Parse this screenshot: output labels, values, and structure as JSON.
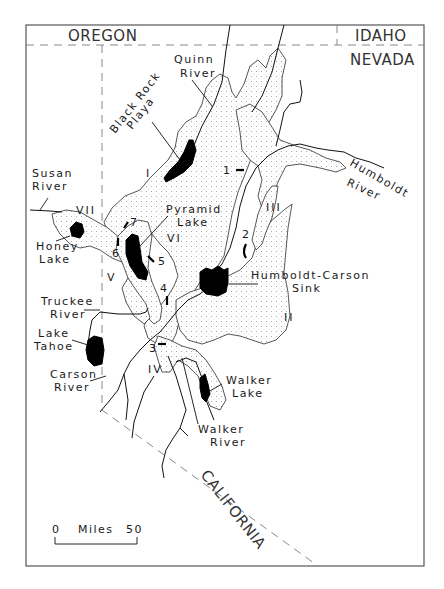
{
  "map": {
    "states": {
      "oregon": "OREGON",
      "idaho": "IDAHO",
      "nevada": "NEVADA",
      "california": "CALIFORNIA"
    },
    "features": {
      "quinn_river": [
        "Quinn",
        "River"
      ],
      "black_rock_playa": [
        "Black Rock",
        "Playa"
      ],
      "susan_river": [
        "Susan",
        "River"
      ],
      "honey_lake": [
        "Honey",
        "Lake"
      ],
      "pyramid_lake": [
        "Pyramid",
        "Lake"
      ],
      "humboldt_river": [
        "Humboldt",
        "River"
      ],
      "humboldt_carson_sink": [
        "Humboldt-Carson",
        "Sink"
      ],
      "truckee_river": [
        "Truckee",
        "River"
      ],
      "lake_tahoe": [
        "Lake",
        "Tahoe"
      ],
      "carson_river": [
        "Carson",
        "River"
      ],
      "walker_lake": [
        "Walker",
        "Lake"
      ],
      "walker_river": [
        "Walker",
        "River"
      ]
    },
    "subbasins": [
      "I",
      "II",
      "III",
      "IV",
      "V",
      "VI",
      "VII"
    ],
    "sills": [
      "1",
      "2",
      "3",
      "4",
      "5",
      "6",
      "7"
    ],
    "scale_bar": {
      "start": "0",
      "unit": "Miles",
      "end": "50"
    },
    "colors": {
      "lake_fill": "#000000",
      "basin_stipple": "#9a9a9a",
      "border_dash": "#888888",
      "frame": "#555555"
    }
  }
}
